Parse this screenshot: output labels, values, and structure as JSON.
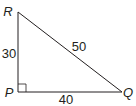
{
  "diagram": {
    "type": "right-triangle",
    "vertices": {
      "R": {
        "label": "R",
        "x": 18,
        "y": 12
      },
      "P": {
        "label": "P",
        "x": 18,
        "y": 92
      },
      "Q": {
        "label": "Q",
        "x": 122,
        "y": 92
      }
    },
    "sides": {
      "RP": {
        "label": "30"
      },
      "RQ": {
        "label": "50"
      },
      "PQ": {
        "label": "40"
      }
    },
    "right_angle_at": "P",
    "colors": {
      "stroke": "#231f20",
      "background": "#ffffff"
    }
  }
}
